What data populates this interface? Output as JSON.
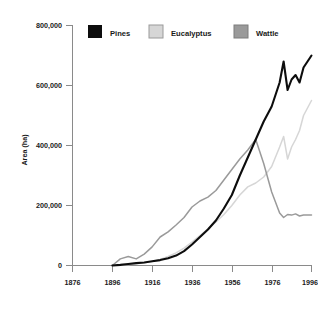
{
  "chart_data": {
    "type": "line",
    "title": "",
    "xlabel": "",
    "ylabel": "Area (ha)",
    "xlim": [
      1876,
      1996
    ],
    "ylim": [
      0,
      800000
    ],
    "grid": false,
    "legend_position": "top",
    "xticks": [
      1876,
      1896,
      1916,
      1936,
      1956,
      1976,
      1996
    ],
    "xtick_labels": [
      "1876",
      "1896",
      "1916",
      "1936",
      "1956",
      "1976",
      "1996"
    ],
    "yticks": [
      0,
      200000,
      400000,
      600000,
      800000
    ],
    "ytick_labels": [
      "0",
      "200,000",
      "400,000",
      "600,000",
      "800,000"
    ],
    "x": [
      1896,
      1900,
      1904,
      1908,
      1912,
      1916,
      1920,
      1924,
      1928,
      1932,
      1936,
      1940,
      1944,
      1948,
      1952,
      1956,
      1960,
      1964,
      1968,
      1972,
      1976,
      1980,
      1982,
      1984,
      1986,
      1988,
      1990,
      1992,
      1996
    ],
    "series": [
      {
        "name": "Pines",
        "color": "#0d0d0d",
        "values": [
          0,
          2000,
          5000,
          8000,
          10000,
          14000,
          18000,
          24000,
          33000,
          48000,
          70000,
          95000,
          120000,
          150000,
          190000,
          235000,
          300000,
          360000,
          420000,
          480000,
          530000,
          610000,
          680000,
          585000,
          620000,
          635000,
          610000,
          660000,
          700000
        ]
      },
      {
        "name": "Eucalyptus",
        "color": "#d6d6d6",
        "values": [
          0,
          1000,
          3000,
          6000,
          9000,
          13000,
          20000,
          30000,
          42000,
          58000,
          78000,
          100000,
          122000,
          145000,
          170000,
          200000,
          235000,
          262000,
          275000,
          295000,
          330000,
          395000,
          430000,
          355000,
          395000,
          420000,
          450000,
          500000,
          550000
        ]
      },
      {
        "name": "Wattle",
        "color": "#9a9a9a",
        "values": [
          0,
          22000,
          30000,
          22000,
          38000,
          62000,
          95000,
          112000,
          135000,
          160000,
          195000,
          215000,
          228000,
          250000,
          285000,
          320000,
          355000,
          385000,
          420000,
          340000,
          245000,
          175000,
          160000,
          170000,
          168000,
          172000,
          165000,
          168000,
          168000
        ]
      }
    ]
  },
  "legend": {
    "items": [
      {
        "label": "Pines",
        "color": "#0d0d0d"
      },
      {
        "label": "Eucalyptus",
        "color": "#d6d6d6"
      },
      {
        "label": "Wattle",
        "color": "#9a9a9a"
      }
    ]
  },
  "axes": {
    "y_title": "Area (ha)"
  }
}
